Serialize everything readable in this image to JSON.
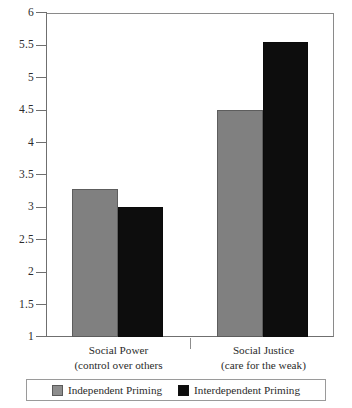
{
  "chart_data": {
    "type": "bar",
    "title": "",
    "subtitle": "",
    "xlabel": "",
    "ylabel": "",
    "categories": [
      "Social Power\n(control over others",
      "Social Justice\n(care for the weak)"
    ],
    "category_labels": [
      {
        "line1": "Social Power",
        "line2": "(control over others"
      },
      {
        "line1": "Social Justice",
        "line2": "(care for the weak)"
      }
    ],
    "series": [
      {
        "name": "Independent Priming",
        "color": "#808080",
        "values": [
          3.28,
          4.5
        ]
      },
      {
        "name": "Interdependent Priming",
        "color": "#0d0d0d",
        "values": [
          3.0,
          5.55
        ]
      }
    ],
    "ylim": [
      1,
      6
    ],
    "ytick_step": 0.5,
    "ytick_labels": [
      "6",
      "5.5",
      "5",
      "4.5",
      "4",
      "3.5",
      "3",
      "2.5",
      "2",
      "1.5",
      "1"
    ],
    "ytick_values": [
      6,
      5.5,
      5,
      4.5,
      4,
      3.5,
      3,
      2.5,
      2,
      1.5,
      1
    ],
    "grid": false,
    "legend_position": "bottom"
  },
  "legend": {
    "entries": [
      {
        "label": "Independent Priming",
        "swatch": "gray-swatch-icon"
      },
      {
        "label": "Interdependent Priming",
        "swatch": "black-swatch-icon"
      }
    ]
  },
  "colors": {
    "bar_gray": "#808080",
    "bar_black": "#0d0d0d",
    "axis": "#6f6f6f",
    "text": "#2b2b2b",
    "background": "#ffffff"
  }
}
